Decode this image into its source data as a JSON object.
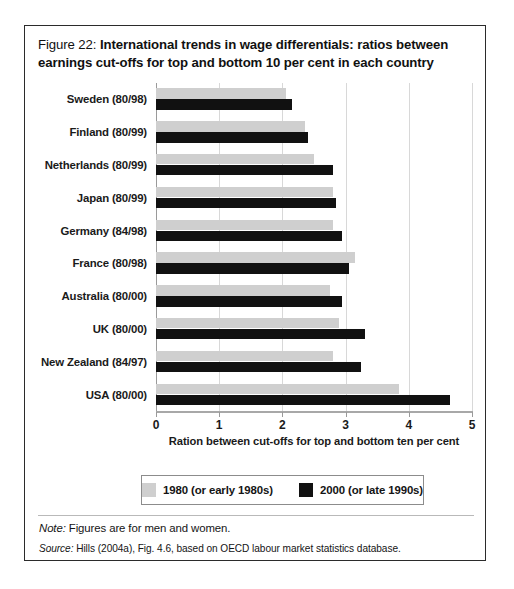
{
  "figure": {
    "title_lead": "Figure 22: ",
    "title_strong": "International trends in wage differentials: ratios between earnings cut-offs for top and bottom 10 per cent in each country",
    "note_label": "Note:",
    "note_text": " Figures are for men and women.",
    "source_label": "Source:",
    "source_text": " Hills (2004a), Fig. 4.6, based on OECD labour market statistics database."
  },
  "legend": {
    "items": [
      {
        "label": "1980 (or early 1980s)",
        "color": "#cfcfcf",
        "swatch_name": "legend-swatch-1980"
      },
      {
        "label": "2000 (or late 1990s)",
        "color": "#111111",
        "swatch_name": "legend-swatch-2000"
      }
    ]
  },
  "chart_data": {
    "type": "bar",
    "orientation": "horizontal",
    "title": "Figure 22: International trends in wage differentials: ratios between earnings cut-offs for top and bottom 10 per cent in each country",
    "xlabel": "Ration between cut-offs for top and bottom ten per cent",
    "ylabel": "",
    "xlim": [
      0,
      5
    ],
    "xticks": [
      0,
      1,
      2,
      3,
      4,
      5
    ],
    "xtick_labels": [
      "0",
      "1",
      "2",
      "3",
      "4",
      "5"
    ],
    "grid": true,
    "grid_axis": "x",
    "legend_position": "bottom",
    "categories": [
      "Sweden (80/98)",
      "Finland (80/99)",
      "Netherlands (80/99)",
      "Japan (80/99)",
      "Germany (84/98)",
      "France (80/98)",
      "Australia (80/00)",
      "UK (80/00)",
      "New Zealand (84/97)",
      "USA (80/00)"
    ],
    "series": [
      {
        "name": "1980 (or early 1980s)",
        "color": "#cfcfcf",
        "values": [
          2.05,
          2.35,
          2.5,
          2.8,
          2.8,
          3.15,
          2.75,
          2.9,
          2.8,
          3.85
        ]
      },
      {
        "name": "2000 (or late 1990s)",
        "color": "#111111",
        "values": [
          2.15,
          2.4,
          2.8,
          2.85,
          2.95,
          3.05,
          2.95,
          3.3,
          3.25,
          4.65
        ]
      }
    ]
  }
}
